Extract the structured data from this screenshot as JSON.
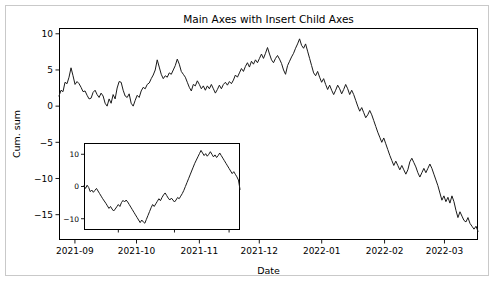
{
  "figure": {
    "background_color": "#ffffff",
    "border_color": "#c9c9c9",
    "line_color": "#1a1a1a",
    "width": 496,
    "height": 282
  },
  "chart_data": {
    "type": "line",
    "title": "Main Axes with Insert Child Axes",
    "xlabel": "Date",
    "ylabel": "Cum. sum",
    "grid": false,
    "legend": "none",
    "xtick_labels": [
      "2021-09",
      "2021-10",
      "2021-11",
      "2021-12",
      "2022-01",
      "2022-02",
      "2022-03"
    ],
    "ytick_labels": [
      "10",
      "5",
      "0",
      "-5",
      "-10",
      "-15"
    ],
    "ytick_values": [
      10,
      5,
      0,
      -5,
      -10,
      -15
    ],
    "xlim": [
      "2021-08-27",
      "2022-03-16"
    ],
    "ylim": [
      -18.5,
      10.8
    ],
    "x_index_range": [
      0,
      200
    ],
    "values": [
      1.4,
      2.2,
      2.0,
      3.3,
      3.1,
      4.0,
      5.3,
      4.2,
      3.0,
      3.4,
      3.1,
      2.6,
      2.0,
      2.1,
      1.5,
      1.0,
      1.1,
      1.9,
      2.2,
      1.6,
      1.2,
      1.8,
      1.4,
      0.4,
      0.0,
      1.0,
      0.4,
      1.6,
      1.0,
      2.5,
      3.4,
      3.3,
      2.2,
      1.4,
      1.2,
      1.7,
      0.4,
      0.0,
      0.8,
      1.5,
      1.2,
      2.1,
      2.6,
      2.4,
      3.0,
      3.2,
      3.8,
      4.3,
      5.0,
      6.4,
      5.4,
      4.4,
      3.8,
      4.2,
      4.0,
      4.6,
      4.4,
      5.0,
      5.6,
      6.5,
      5.8,
      4.8,
      4.4,
      4.0,
      3.3,
      2.6,
      2.1,
      3.0,
      2.8,
      3.5,
      3.0,
      2.4,
      2.8,
      2.2,
      2.8,
      2.4,
      3.0,
      2.4,
      1.8,
      2.3,
      2.9,
      2.4,
      3.0,
      3.3,
      2.9,
      3.4,
      3.1,
      3.6,
      4.3,
      4.0,
      4.6,
      5.2,
      4.8,
      5.5,
      6.0,
      5.4,
      6.2,
      5.8,
      6.4,
      6.0,
      6.6,
      7.2,
      6.6,
      7.3,
      8.1,
      7.2,
      6.4,
      6.0,
      6.6,
      7.0,
      6.5,
      5.9,
      5.0,
      4.4,
      5.6,
      6.2,
      6.8,
      7.3,
      8.0,
      8.6,
      9.3,
      8.4,
      8.0,
      8.6,
      7.6,
      6.6,
      5.6,
      4.6,
      4.2,
      4.8,
      4.0,
      3.3,
      3.8,
      3.0,
      2.3,
      2.9,
      2.2,
      1.6,
      2.2,
      2.9,
      2.4,
      1.7,
      2.3,
      3.0,
      2.4,
      1.6,
      2.2,
      1.6,
      0.8,
      0.0,
      -0.7,
      -0.2,
      -0.9,
      -1.6,
      -1.2,
      -0.6,
      -1.2,
      -2.0,
      -2.8,
      -3.6,
      -4.3,
      -5.0,
      -4.4,
      -5.2,
      -6.0,
      -6.8,
      -7.5,
      -8.2,
      -7.6,
      -8.2,
      -8.8,
      -8.2,
      -8.8,
      -9.4,
      -8.8,
      -7.7,
      -7.2,
      -7.8,
      -8.4,
      -9.2,
      -9.8,
      -9.2,
      -8.6,
      -9.2,
      -8.6,
      -8.0,
      -8.6,
      -9.4,
      -10.2,
      -11.0,
      -12.0,
      -13.0,
      -12.4,
      -13.2,
      -12.6,
      -13.4,
      -12.4,
      -13.2,
      -14.4,
      -15.4,
      -14.6,
      -15.2,
      -15.8,
      -16.0,
      -15.4,
      -16.2,
      -16.6,
      -17.0,
      -16.6,
      -17.3
    ]
  },
  "inset_chart_data": {
    "type": "line",
    "title": "",
    "xlabel": "",
    "ylabel": "",
    "grid": false,
    "legend": "none",
    "ytick_labels": [
      "10",
      "0",
      "-10"
    ],
    "ytick_values": [
      10,
      0,
      -10
    ],
    "xtick_labels": [],
    "ylim": [
      -13.5,
      13.5
    ],
    "x_index_range": [
      0,
      100
    ],
    "values": [
      0.2,
      -0.6,
      0.4,
      -0.3,
      -1.6,
      -1.1,
      -1.8,
      -1.2,
      -0.6,
      -1.4,
      -2.2,
      -3.0,
      -3.8,
      -4.5,
      -5.2,
      -6.0,
      -6.8,
      -6.2,
      -7.0,
      -7.6,
      -7.0,
      -6.3,
      -5.6,
      -6.2,
      -5.0,
      -4.3,
      -4.8,
      -4.2,
      -4.8,
      -5.6,
      -6.4,
      -7.2,
      -8.0,
      -8.8,
      -9.6,
      -10.4,
      -11.2,
      -10.4,
      -11.0,
      -11.4,
      -10.2,
      -9.0,
      -7.8,
      -6.6,
      -5.6,
      -6.2,
      -5.4,
      -4.6,
      -3.8,
      -4.4,
      -3.4,
      -2.6,
      -2.0,
      -2.8,
      -3.6,
      -4.2,
      -3.6,
      -4.2,
      -4.8,
      -4.2,
      -3.4,
      -3.8,
      -3.0,
      -2.2,
      -1.2,
      0.0,
      1.2,
      2.4,
      3.6,
      4.8,
      6.0,
      7.2,
      8.2,
      9.2,
      10.2,
      11.2,
      10.4,
      9.6,
      10.2,
      9.4,
      10.0,
      10.8,
      10.0,
      9.2,
      9.8,
      9.0,
      9.6,
      10.4,
      9.6,
      8.8,
      8.0,
      7.2,
      6.4,
      5.6,
      4.8,
      4.0,
      4.6,
      3.8,
      3.0,
      2.0,
      -0.9
    ]
  },
  "axes_geometry": {
    "main": {
      "left": 59,
      "top": 28,
      "right": 478,
      "bottom": 240
    },
    "inset": {
      "left": 84,
      "top": 143,
      "right": 240,
      "bottom": 230
    }
  }
}
